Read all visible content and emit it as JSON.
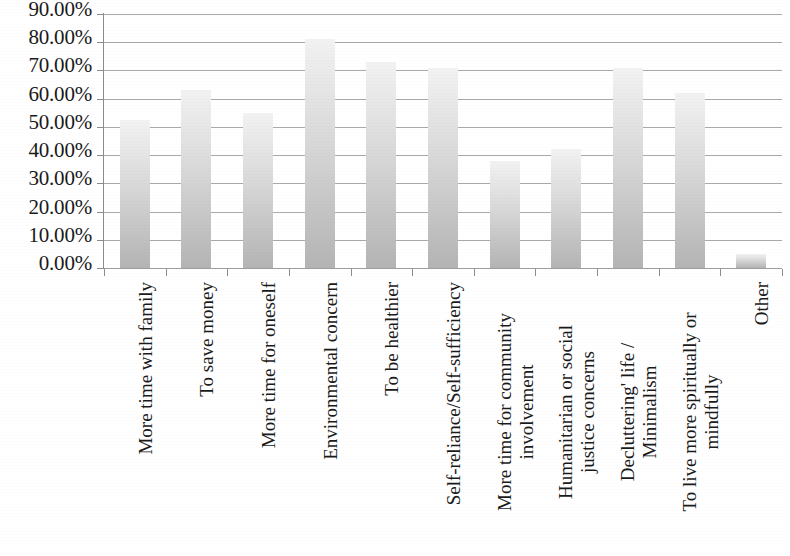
{
  "chart_data": {
    "type": "bar",
    "title": "",
    "subtitle": "",
    "xlabel": "",
    "ylabel": "",
    "ylim": [
      0,
      90
    ],
    "grid": true,
    "legend": false,
    "legend_position": "none",
    "y_tick_labels": [
      "90.00%",
      "80.00%",
      "70.00%",
      "60.00%",
      "50.00%",
      "40.00%",
      "30.00%",
      "20.00%",
      "10.00%",
      "0.00%"
    ],
    "y_tick_values": [
      90,
      80,
      70,
      60,
      50,
      40,
      30,
      20,
      10,
      0
    ],
    "categories": [
      "More time with family",
      "To save money",
      "More time for oneself",
      "Environmental concern",
      "To be healthier",
      "Self-reliance/Self-sufficiency",
      "More time for community involvement",
      "Humanitarian or social justice concerns",
      "Decluttering' life / Minimalism",
      "To live more spiritually or mindfully",
      "Other"
    ],
    "category_lines": [
      [
        "More time with family"
      ],
      [
        "To save money"
      ],
      [
        "More time for oneself"
      ],
      [
        "Environmental concern"
      ],
      [
        "To be healthier"
      ],
      [
        "Self-reliance/Self-sufficiency"
      ],
      [
        "More time for community",
        "involvement"
      ],
      [
        "Humanitarian or social",
        "justice concerns"
      ],
      [
        "Decluttering' life /",
        "Minimalism"
      ],
      [
        "To live more spiritually or",
        "mindfully"
      ],
      [
        "Other"
      ]
    ],
    "values": [
      52.5,
      63.0,
      55.0,
      81.0,
      73.0,
      71.0,
      38.0,
      42.0,
      71.0,
      62.0,
      5.0
    ],
    "value_labels": [
      "52.50%",
      "63.00%",
      "55.00%",
      "81.00%",
      "73.00%",
      "71.00%",
      "38.00%",
      "42.00%",
      "71.00%",
      "62.00%",
      "5.00%"
    ],
    "colors": {
      "bar_top": "#f2f2f2",
      "bar_bottom": "#b4b4b4",
      "gridline": "#9a9a9a",
      "axis": "#8c8c8c",
      "text": "#1a1a1a",
      "background": "#ffffff"
    }
  }
}
